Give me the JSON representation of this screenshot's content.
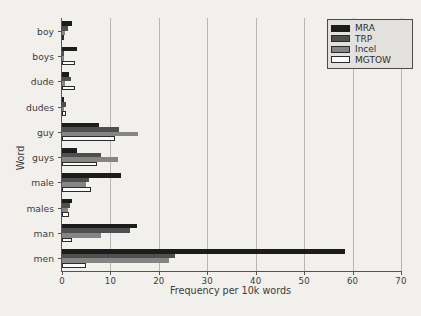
{
  "chart_data": {
    "type": "bar",
    "orientation": "horizontal",
    "title": "",
    "xlabel": "Frequency per 10k words",
    "ylabel": "Word",
    "xlim": [
      0,
      70
    ],
    "ylim": null,
    "grid": true,
    "grid_axis": "x",
    "xticks": [
      0,
      10,
      20,
      30,
      40,
      50,
      60,
      70
    ],
    "xticklabels": [
      "0",
      "10",
      "20",
      "30",
      "40",
      "50",
      "60",
      "70"
    ],
    "categories": [
      "boy",
      "boys",
      "dude",
      "dudes",
      "guy",
      "guys",
      "male",
      "males",
      "man",
      "men"
    ],
    "legend": {
      "position": "upper right",
      "entries": [
        "MRA",
        "TRP",
        "Incel",
        "MGTOW"
      ]
    },
    "series": [
      {
        "name": "MRA",
        "color": "#1c1c1c",
        "values": [
          2.0,
          3.2,
          1.5,
          0.5,
          7.6,
          3.2,
          12.2,
          2.1,
          15.5,
          58.5
        ]
      },
      {
        "name": "TRP",
        "color": "#4f4f4f",
        "values": [
          1.3,
          0.5,
          1.9,
          0.9,
          11.8,
          8.0,
          5.6,
          1.6,
          14.0,
          23.4
        ]
      },
      {
        "name": "Incel",
        "color": "#858585",
        "values": [
          0.7,
          0.4,
          0.6,
          0.5,
          15.6,
          11.6,
          5.0,
          1.2,
          8.0,
          22.0
        ]
      },
      {
        "name": "MGTOW",
        "color": "#ffffff",
        "values": [
          0.5,
          2.7,
          2.7,
          0.9,
          11.0,
          7.2,
          6.0,
          1.4,
          2.0,
          5.0
        ]
      }
    ]
  }
}
